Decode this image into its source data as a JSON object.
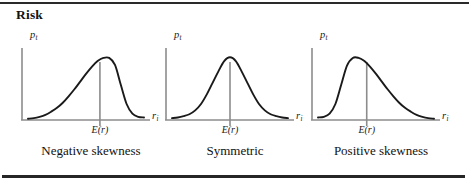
{
  "figure": {
    "title": "Risk",
    "background_color": "#ffffff",
    "rule_color": "#2a2a2a"
  },
  "axes_labels": {
    "y_symbol": "p",
    "y_subscript": "t",
    "x_symbol": "r",
    "x_subscript": "i",
    "mean_label": "E(r)"
  },
  "style": {
    "curve_color": "#1a1a1a",
    "axis_color": "#8c8c8c",
    "mean_line_color": "#8c8c8c"
  },
  "chart_data": [
    {
      "type": "line",
      "title": "Negative skewness",
      "xlabel": "r_i",
      "ylabel": "p_t",
      "grid": false,
      "legend": "none",
      "xlim": [
        0,
        1
      ],
      "ylim": [
        0,
        1
      ],
      "annotations": [
        "E(r)"
      ],
      "mean_x": 0.62,
      "description": "Probability density with a long left tail; mode lies to the right of the mean marker.",
      "x": [
        0.0,
        0.05,
        0.1,
        0.15,
        0.2,
        0.25,
        0.3,
        0.35,
        0.4,
        0.45,
        0.5,
        0.55,
        0.6,
        0.65,
        0.7,
        0.75,
        0.8,
        0.85,
        0.9,
        0.95,
        1.0
      ],
      "y": [
        0.02,
        0.03,
        0.05,
        0.08,
        0.13,
        0.19,
        0.27,
        0.37,
        0.48,
        0.6,
        0.72,
        0.83,
        0.92,
        0.97,
        0.97,
        0.86,
        0.55,
        0.25,
        0.1,
        0.05,
        0.04
      ]
    },
    {
      "type": "line",
      "title": "Symmetric",
      "xlabel": "r_i",
      "ylabel": "p_t",
      "grid": false,
      "legend": "none",
      "xlim": [
        0,
        1
      ],
      "ylim": [
        0,
        1
      ],
      "annotations": [
        "E(r)"
      ],
      "mean_x": 0.5,
      "description": "Symmetric bell-shaped probability density centred on the mean marker.",
      "x": [
        0.0,
        0.05,
        0.1,
        0.15,
        0.2,
        0.25,
        0.3,
        0.35,
        0.4,
        0.45,
        0.5,
        0.55,
        0.6,
        0.65,
        0.7,
        0.75,
        0.8,
        0.85,
        0.9,
        0.95,
        1.0
      ],
      "y": [
        0.03,
        0.04,
        0.06,
        0.09,
        0.15,
        0.25,
        0.4,
        0.58,
        0.76,
        0.92,
        0.98,
        0.92,
        0.76,
        0.58,
        0.4,
        0.25,
        0.15,
        0.09,
        0.06,
        0.04,
        0.03
      ]
    },
    {
      "type": "line",
      "title": "Positive skewness",
      "xlabel": "r_i",
      "ylabel": "p_t",
      "grid": false,
      "legend": "none",
      "xlim": [
        0,
        1
      ],
      "ylim": [
        0,
        1
      ],
      "annotations": [
        "E(r)"
      ],
      "mean_x": 0.42,
      "description": "Probability density with a long right tail; mode lies to the left of the mean marker.",
      "x": [
        0.0,
        0.05,
        0.1,
        0.15,
        0.2,
        0.25,
        0.3,
        0.35,
        0.4,
        0.45,
        0.5,
        0.55,
        0.6,
        0.65,
        0.7,
        0.75,
        0.8,
        0.85,
        0.9,
        0.95,
        1.0
      ],
      "y": [
        0.04,
        0.05,
        0.1,
        0.25,
        0.55,
        0.85,
        0.97,
        0.97,
        0.92,
        0.83,
        0.72,
        0.6,
        0.48,
        0.37,
        0.27,
        0.19,
        0.13,
        0.08,
        0.05,
        0.03,
        0.02
      ]
    }
  ],
  "panels": [
    {
      "left": 16,
      "caption": "Negative skewness"
    },
    {
      "left": 160,
      "caption": "Symmetric"
    },
    {
      "left": 306,
      "caption": "Positive skewness"
    }
  ]
}
